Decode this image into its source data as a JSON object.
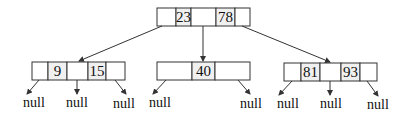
{
  "diagram": {
    "type": "b-tree",
    "root": {
      "keys": [
        "23",
        "78"
      ]
    },
    "children": [
      {
        "keys": [
          "9",
          "15"
        ],
        "children": [
          "null",
          "null",
          "null"
        ]
      },
      {
        "keys": [
          "40"
        ],
        "children": [
          "null",
          "null"
        ]
      },
      {
        "keys": [
          "81",
          "93"
        ],
        "children": [
          "null",
          "null",
          "null"
        ]
      }
    ],
    "null_label": "null",
    "colors": {
      "line": "#333333",
      "key_cell_fill": "#f0f0f0",
      "text": "#111111"
    }
  }
}
